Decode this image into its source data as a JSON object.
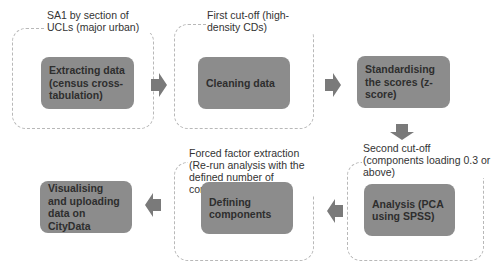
{
  "groups": [
    {
      "id": "g1",
      "caption": "SA1 by section of UCLs (major urban)"
    },
    {
      "id": "g2",
      "caption": "First cut-off (high-density CDs)"
    },
    {
      "id": "g3",
      "caption": "Second cut-off (components loading 0.3 or above)"
    },
    {
      "id": "g4",
      "caption": "Forced factor extraction (Re-run analysis with the defined number of components)"
    }
  ],
  "steps": [
    {
      "id": "s1",
      "label": "Extracting data (census cross-tabulation)"
    },
    {
      "id": "s2",
      "label": "Cleaning data"
    },
    {
      "id": "s3",
      "label": "Standardising the scores (z-score)"
    },
    {
      "id": "s4",
      "label": "Analysis (PCA using SPSS)"
    },
    {
      "id": "s5",
      "label": "Defining components"
    },
    {
      "id": "s6",
      "label": "Visualising and uploading data on CityData"
    }
  ],
  "colors": {
    "step_fill": "#8c8c8c",
    "arrow_fill": "#7a7a7a",
    "group_border": "#b8b8b8"
  }
}
